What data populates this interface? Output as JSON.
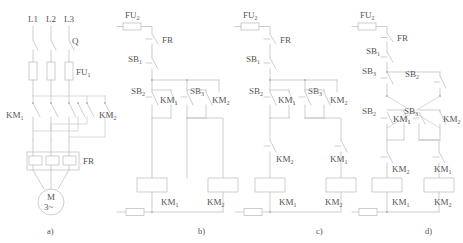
{
  "figure": {
    "line_color": "#b9b9b9",
    "text_color": "#555555",
    "background": "#ffffff"
  },
  "captions": [
    {
      "id": "a",
      "text": "a)"
    },
    {
      "id": "b",
      "text": "b)"
    },
    {
      "id": "c",
      "text": "c)"
    },
    {
      "id": "d",
      "text": "d)"
    }
  ],
  "panel_a": {
    "caption": "a)",
    "supply_labels": [
      "L1",
      "L2",
      "L3"
    ],
    "switch_label": "Q",
    "fuse_label": "FU",
    "fuse_sub": "1",
    "contactor_left": "KM",
    "contactor_left_sub": "1",
    "contactor_right": "KM",
    "contactor_right_sub": "2",
    "overload_label": "FR",
    "motor_label": "M",
    "motor_phase": "3~"
  },
  "panel_b": {
    "caption": "b)",
    "fuse_label": "FU",
    "fuse_sub": "2",
    "overload_label": "FR",
    "stop_label": "SB",
    "stop_sub": "1",
    "start_left_label": "SB",
    "start_left_sub": "2",
    "start_right_label": "SB",
    "start_right_sub": "3",
    "hold_left_label": "KM",
    "hold_left_sub": "1",
    "hold_right_label": "KM",
    "hold_right_sub": "2",
    "coil_left_label": "KM",
    "coil_left_sub": "1",
    "coil_right_label": "KM",
    "coil_right_sub": "2"
  },
  "panel_c": {
    "caption": "c)",
    "fuse_label": "FU",
    "fuse_sub": "2",
    "overload_label": "FR",
    "stop_label": "SB",
    "stop_sub": "1",
    "start_left_label": "SB",
    "start_left_sub": "2",
    "start_right_label": "SB",
    "start_right_sub": "3",
    "hold_left_label": "KM",
    "hold_left_sub": "1",
    "hold_right_label": "KM",
    "hold_right_sub": "2",
    "interlock_left_label": "KM",
    "interlock_left_sub": "2",
    "interlock_right_label": "KM",
    "interlock_right_sub": "1",
    "coil_left_label": "KM",
    "coil_left_sub": "1",
    "coil_right_label": "KM",
    "coil_right_sub": "2"
  },
  "panel_d": {
    "caption": "d)",
    "fuse_label": "FU",
    "fuse_sub": "2",
    "overload_label": "FR",
    "stop_label": "SB",
    "stop_sub": "1",
    "nc_left_label": "SB",
    "nc_left_sub": "3",
    "nc_right_label": "SB",
    "nc_right_sub": "2",
    "start_left_label": "SB",
    "start_left_sub": "2",
    "start_right_label": "SB",
    "start_right_sub": "3",
    "hold_left_label": "KM",
    "hold_left_sub": "1",
    "hold_right_label": "KM",
    "hold_right_sub": "2",
    "interlock_left_label": "KM",
    "interlock_left_sub": "2",
    "interlock_right_label": "KM",
    "interlock_right_sub": "1",
    "coil_left_label": "KM",
    "coil_left_sub": "1",
    "coil_right_label": "KM",
    "coil_right_sub": "2"
  }
}
